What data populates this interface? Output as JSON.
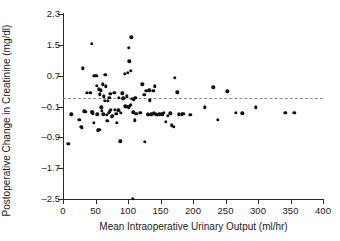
{
  "chart_data": {
    "type": "scatter",
    "title": "",
    "xlabel": "Mean Intraoperative Urinary Output (ml/hr)",
    "ylabel": "Postoperative Change in Creatinine (mg/dl)",
    "xlim": [
      0,
      400
    ],
    "ylim": [
      -2.5,
      2.3
    ],
    "xticks": [
      0,
      50,
      100,
      150,
      200,
      250,
      300,
      350,
      400
    ],
    "xtick_labels": [
      "0",
      "50",
      "100",
      "150",
      "200",
      "250",
      "300",
      "350",
      "400"
    ],
    "yticks": [
      -2.5,
      -1.7,
      -0.9,
      -0.1,
      0.7,
      1.5,
      2.3
    ],
    "ytick_labels": [
      "-2.5",
      "-1.7",
      "-0.9",
      "-0.1",
      "0.7",
      "1.5",
      "2.3"
    ],
    "grid": false,
    "legend": null,
    "reference_line": {
      "orientation": "horizontal",
      "y": 0.13,
      "style": "dashed",
      "color": "#8c8c8c"
    },
    "marker": {
      "shape": "circle",
      "color": "#111111",
      "size": 3.4
    },
    "points": [
      [
        8,
        -1.07
      ],
      [
        13,
        -0.3
      ],
      [
        25,
        -0.45
      ],
      [
        28,
        -0.62
      ],
      [
        30,
        0.89
      ],
      [
        29,
        -0.65
      ],
      [
        33,
        -0.22
      ],
      [
        35,
        -0.23
      ],
      [
        37,
        0.25
      ],
      [
        42,
        0.26
      ],
      [
        44,
        1.52
      ],
      [
        44,
        -0.25
      ],
      [
        45,
        -0.24
      ],
      [
        46,
        -0.28
      ],
      [
        47,
        -0.53
      ],
      [
        48,
        0.7
      ],
      [
        51,
        0.69
      ],
      [
        52,
        0.43
      ],
      [
        53,
        -0.3
      ],
      [
        55,
        0.35
      ],
      [
        54,
        -0.72
      ],
      [
        56,
        -0.71
      ],
      [
        57,
        0.22
      ],
      [
        58,
        0.32
      ],
      [
        59,
        -0.12
      ],
      [
        60,
        -0.21
      ],
      [
        61,
        0.48
      ],
      [
        62,
        -0.3
      ],
      [
        63,
        0.16
      ],
      [
        64,
        0.05
      ],
      [
        65,
        0.73
      ],
      [
        66,
        0.42
      ],
      [
        67,
        -0.31
      ],
      [
        68,
        -0.47
      ],
      [
        69,
        0.04
      ],
      [
        70,
        -0.26
      ],
      [
        71,
        0.13
      ],
      [
        72,
        -0.22
      ],
      [
        73,
        0.23
      ],
      [
        74,
        -0.19
      ],
      [
        75,
        -0.36
      ],
      [
        76,
        -0.34
      ],
      [
        79,
        0.25
      ],
      [
        80,
        -0.18
      ],
      [
        82,
        -0.29
      ],
      [
        83,
        -0.52
      ],
      [
        85,
        -0.2
      ],
      [
        86,
        0.12
      ],
      [
        88,
        -1.0
      ],
      [
        89,
        -0.26
      ],
      [
        91,
        0.24
      ],
      [
        92,
        0.1
      ],
      [
        93,
        0.11
      ],
      [
        95,
        0.75
      ],
      [
        96,
        -0.09
      ],
      [
        97,
        -0.11
      ],
      [
        98,
        0.16
      ],
      [
        99,
        -0.1
      ],
      [
        100,
        0.78
      ],
      [
        101,
        1.43
      ],
      [
        101,
        -0.12
      ],
      [
        102,
        1.07
      ],
      [
        103,
        -0.08
      ],
      [
        104,
        0.82
      ],
      [
        104,
        -0.05
      ],
      [
        105,
        1.7
      ],
      [
        106,
        0.1
      ],
      [
        107,
        -2.5
      ],
      [
        108,
        -0.25
      ],
      [
        109,
        0.09
      ],
      [
        110,
        -0.46
      ],
      [
        111,
        0.12
      ],
      [
        113,
        -0.29
      ],
      [
        118,
        -0.26
      ],
      [
        120,
        -0.27
      ],
      [
        122,
        0.48
      ],
      [
        125,
        0.2
      ],
      [
        126,
        -1.02
      ],
      [
        128,
        0.3
      ],
      [
        130,
        -0.3
      ],
      [
        131,
        -0.31
      ],
      [
        133,
        0.32
      ],
      [
        134,
        0.06
      ],
      [
        136,
        -0.3
      ],
      [
        138,
        -0.29
      ],
      [
        139,
        0.31
      ],
      [
        140,
        -0.28
      ],
      [
        141,
        0.42
      ],
      [
        143,
        -0.3
      ],
      [
        145,
        -0.31
      ],
      [
        148,
        -0.3
      ],
      [
        152,
        -0.29
      ],
      [
        153,
        -0.3
      ],
      [
        155,
        -0.26
      ],
      [
        158,
        -0.5
      ],
      [
        161,
        -0.34
      ],
      [
        165,
        -0.28
      ],
      [
        167,
        -0.59
      ],
      [
        170,
        -0.63
      ],
      [
        172,
        0.64
      ],
      [
        176,
        0.27
      ],
      [
        178,
        -0.3
      ],
      [
        183,
        -0.3
      ],
      [
        185,
        -0.29
      ],
      [
        196,
        -0.32
      ],
      [
        218,
        -0.12
      ],
      [
        231,
        0.4
      ],
      [
        238,
        -0.45
      ],
      [
        253,
        0.29
      ],
      [
        266,
        -0.26
      ],
      [
        276,
        -0.28
      ],
      [
        297,
        -0.12
      ],
      [
        342,
        -0.27
      ],
      [
        356,
        -0.26
      ]
    ]
  }
}
